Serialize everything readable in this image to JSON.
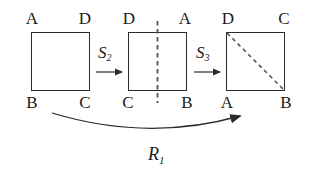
{
  "figure": {
    "stroke_color": "#2b2b2b",
    "text_color": "#1a1a1a",
    "background": "#ffffff"
  },
  "squares": [
    {
      "id": "square-1",
      "corners": {
        "top_left": "A",
        "top_right": "D",
        "bottom_left": "B",
        "bottom_right": "C"
      },
      "overlay": "none"
    },
    {
      "id": "square-2",
      "corners": {
        "top_left": "D",
        "top_right": "A",
        "bottom_left": "C",
        "bottom_right": "B"
      },
      "overlay": "vertical-dashed-axis"
    },
    {
      "id": "square-3",
      "corners": {
        "top_left": "D",
        "top_right": "C",
        "bottom_left": "A",
        "bottom_right": "B"
      },
      "overlay": "diagonal-dashed-axis"
    }
  ],
  "operations": [
    {
      "id": "op-s2",
      "symbol": "S",
      "subscript": "2"
    },
    {
      "id": "op-s3",
      "symbol": "S",
      "subscript": "3"
    }
  ],
  "composite": {
    "id": "op-r1",
    "symbol": "R",
    "subscript": "1"
  }
}
